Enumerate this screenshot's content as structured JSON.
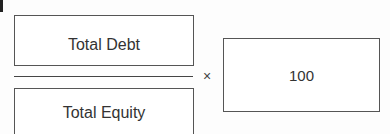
{
  "formula": {
    "numerator": "Total Debt",
    "denominator": "Total Equity",
    "operator": "×",
    "multiplier": "100"
  }
}
